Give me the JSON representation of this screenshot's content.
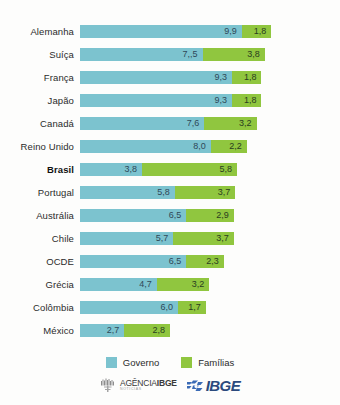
{
  "chart_data": {
    "type": "bar",
    "subtype": "stacked-horizontal",
    "title": "",
    "subtitle": "",
    "xlabel": "",
    "ylabel": "",
    "grid": false,
    "legend_position": "bottom",
    "categories": [
      "Alemanha",
      "Suíça",
      "França",
      "Japão",
      "Canadá",
      "Reino Unido",
      "Brasil",
      "Portugal",
      "Austrália",
      "Chile",
      "OCDE",
      "Grécia",
      "Colômbia",
      "México"
    ],
    "series": [
      {
        "name": "Governo",
        "color": "#7cc3cf",
        "values": [
          9.9,
          7.5,
          9.3,
          9.3,
          7.6,
          8.0,
          3.8,
          5.8,
          6.5,
          5.7,
          6.5,
          4.7,
          6.0,
          2.7
        ],
        "labels": [
          "9,9",
          "7,,5",
          "9,3",
          "9,3",
          "7,6",
          "8,0",
          "3,8",
          "5,8",
          "6,5",
          "5,7",
          "6,5",
          "4,7",
          "6,0",
          "2,7"
        ]
      },
      {
        "name": "Famílias",
        "color": "#90c63f",
        "values": [
          1.8,
          3.8,
          1.8,
          1.8,
          3.2,
          2.2,
          5.8,
          3.7,
          2.9,
          3.7,
          2.3,
          3.2,
          1.7,
          2.8
        ],
        "labels": [
          "1,8",
          "3,8",
          "1,8",
          "1,8",
          "3,2",
          "2,2",
          "5,8",
          "3,7",
          "2,9",
          "3,7",
          "2,3",
          "3,2",
          "1,7",
          "2,8"
        ]
      }
    ],
    "highlight_category": "Brasil",
    "unit_px": 16.35,
    "xlim": [
      0,
      11.7
    ]
  },
  "legend": {
    "items": [
      {
        "label": "Governo",
        "color": "#7cc3cf",
        "swatch_name": "legend-swatch-governo"
      },
      {
        "label": "Famílias",
        "color": "#90c63f",
        "swatch_name": "legend-swatch-familias"
      }
    ]
  },
  "footer": {
    "agencia": {
      "main_prefix": "AGÊNCIA",
      "main_suffix": "IBGE",
      "sub": "NOTÍCIAS"
    },
    "ibge": {
      "wordmark": "IBGE"
    }
  }
}
